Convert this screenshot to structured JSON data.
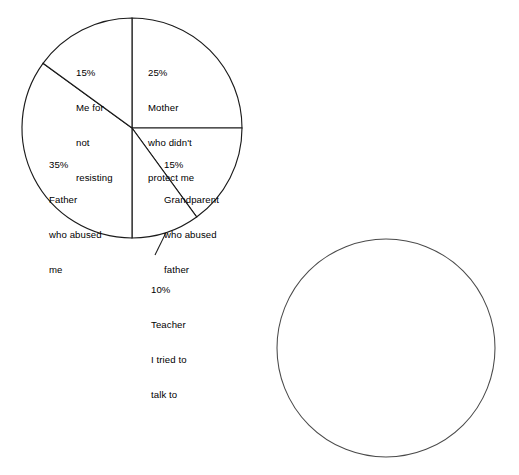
{
  "figure": {
    "background_color": "#ffffff",
    "line_color": "#1b1b1b",
    "text_color": "#000000"
  },
  "chart_data": {
    "type": "pie",
    "title": "",
    "subtitle": "",
    "xlabel": "",
    "ylabel": "",
    "legend_position": "none",
    "grid": false,
    "labels_inside": true,
    "start_angle_deg": 90,
    "direction": "clockwise",
    "categories": [
      "Mother who didn't protect me",
      "Grandparent who abused father",
      "Teacher I tried to talk to",
      "Father who abused me",
      "Me for not resisting"
    ],
    "values": [
      25,
      15,
      10,
      35,
      15
    ],
    "value_labels": [
      "25%",
      "15%",
      "10%",
      "35%",
      "15%"
    ],
    "slice_color": "#ffffff",
    "slice_edge_color": "#1b1b1b"
  },
  "pie_chart": {
    "name": "blame-pie-chart",
    "center_x": 132,
    "center_y": 128,
    "radius": 110,
    "slices": [
      {
        "id": "mother",
        "percent_label": "25%",
        "line1": "Mother",
        "line2": "who didn't",
        "line3": "protect me",
        "line4": "",
        "value": 25
      },
      {
        "id": "grandparent",
        "percent_label": "15%",
        "line1": "Grandparent",
        "line2": "who abused",
        "line3": "father",
        "line4": "",
        "value": 15
      },
      {
        "id": "teacher",
        "percent_label": "10%",
        "line1": "Teacher",
        "line2": "I tried to",
        "line3": "talk to",
        "line4": "",
        "value": 10,
        "callout": true
      },
      {
        "id": "father",
        "percent_label": "35%",
        "line1": "Father",
        "line2": "who abused",
        "line3": "me",
        "line4": "",
        "value": 35
      },
      {
        "id": "me",
        "percent_label": "15%",
        "line1": "Me for",
        "line2": "not",
        "line3": "resisting",
        "line4": "",
        "value": 15
      }
    ]
  },
  "empty_circle": {
    "name": "empty-pie-outline",
    "center_x": 386,
    "center_y": 348,
    "radius": 109,
    "label": ""
  }
}
